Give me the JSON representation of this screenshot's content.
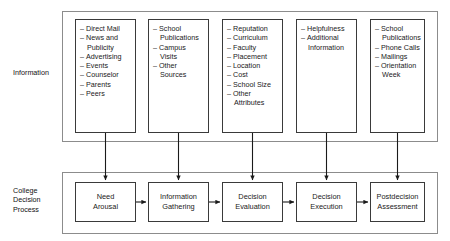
{
  "rows": {
    "information": {
      "label": "Information",
      "columns": [
        {
          "name": "mass-media-sources",
          "items": [
            "Direct Mail",
            "News and\nPublicity",
            "Advertising",
            "Events",
            "Counselor",
            "Parents",
            "Peers"
          ]
        },
        {
          "name": "school-contact-sources",
          "items": [
            "School\nPublications",
            "Campus\nVisits",
            "Other\nSources"
          ]
        },
        {
          "name": "evaluation-attributes",
          "items": [
            "Reputation",
            "Curriculum",
            "Faculty",
            "Placement",
            "Location",
            "Cost",
            "School Size",
            "Other\nAttributes"
          ]
        },
        {
          "name": "execution-support",
          "items": [
            "Helpfulness",
            "Additional\nInformation"
          ]
        },
        {
          "name": "postdecision-contacts",
          "items": [
            "School\nPublications",
            "Phone Calls",
            "Mailings",
            "Orientation\nWeek"
          ]
        }
      ]
    },
    "process": {
      "label": "College\nDecision\nProcess",
      "steps": [
        {
          "name": "need-arousal",
          "label": "Need\nArousal"
        },
        {
          "name": "information-gathering",
          "label": "Information\nGathering"
        },
        {
          "name": "decision-evaluation",
          "label": "Decision\nEvaluation"
        },
        {
          "name": "decision-execution",
          "label": "Decision\nExecution"
        },
        {
          "name": "postdecision-assessment",
          "label": "Postdecision\nAssessment"
        }
      ]
    }
  },
  "colors": {
    "background": "#ffffff",
    "box_border": "#3a3a3a",
    "container_border": "#8c8c8c",
    "arrow": "#1a1a1a",
    "text": "#111111"
  }
}
